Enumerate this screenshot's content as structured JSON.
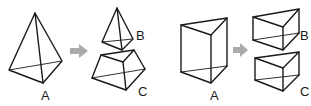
{
  "figure": {
    "left_panel": {
      "description": "Triangular pyramid A cut into smaller pyramid B and frustum C",
      "labels": {
        "whole": "A",
        "top_piece": "B",
        "bottom_piece": "C"
      }
    },
    "right_panel": {
      "description": "Triangular prism A cut into prism B and prism C",
      "labels": {
        "whole": "A",
        "top_piece": "B",
        "bottom_piece": "C"
      }
    },
    "arrow_icon": "right-arrow-icon",
    "colors": {
      "line": "#1a1a1a",
      "arrow": "#aaaaaa",
      "background": "#ffffff"
    }
  }
}
